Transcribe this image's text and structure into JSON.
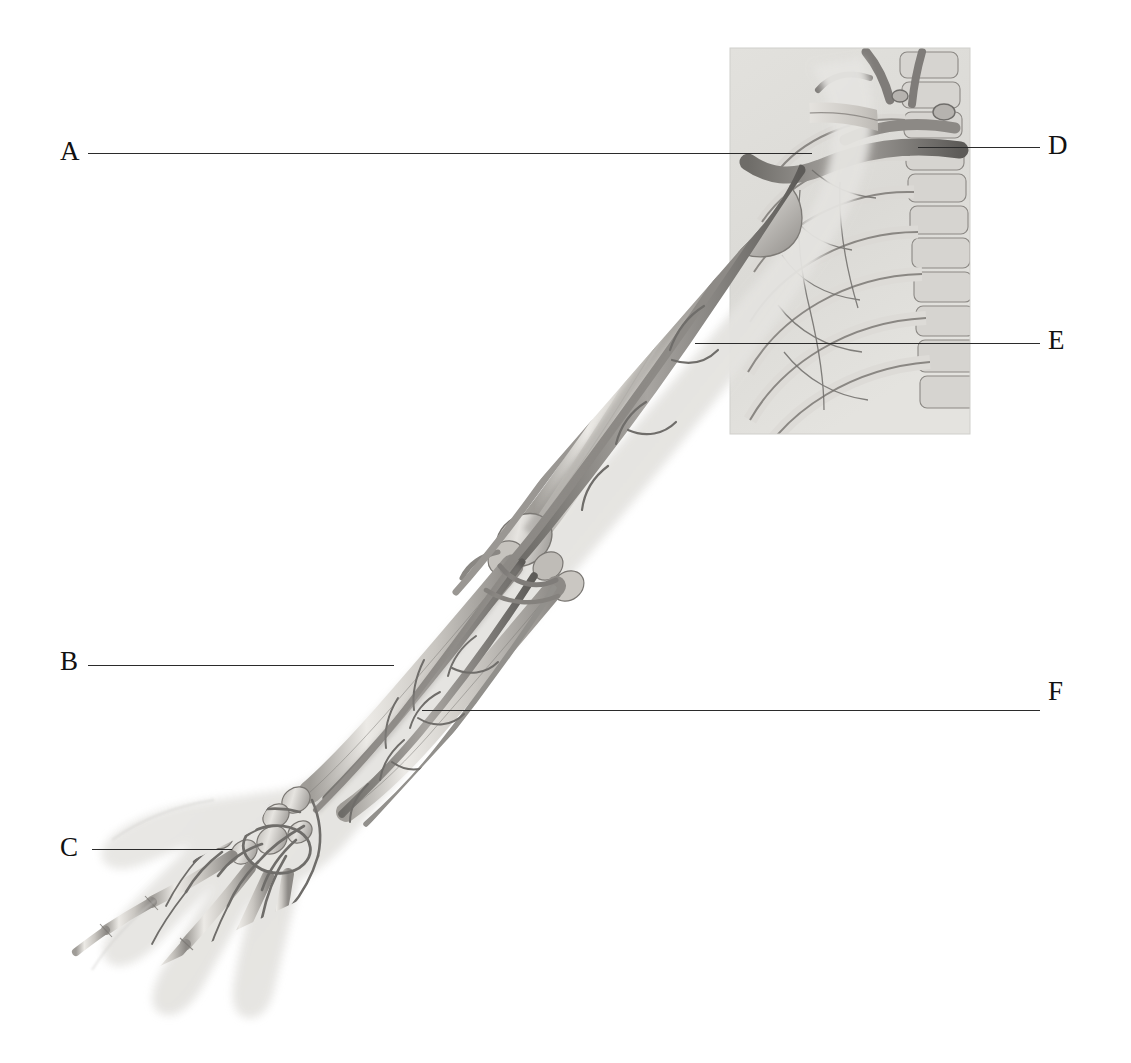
{
  "page": {
    "background_color": "#ffffff",
    "width": 1131,
    "height": 1063,
    "kind": "anatomical-illustration"
  },
  "illustration": {
    "style": "grayscale pencil / airbrush medical illustration",
    "skin_silhouette_color": "#e9e9e9",
    "bone_light": "#dedcd8",
    "bone_mid": "#b4b1ac",
    "bone_dark": "#8b8884",
    "vessel_color": "#7d7b77",
    "vessel_dark": "#5e5c59",
    "thorax_panel": {
      "description": "rectangular cropped panel showing ribcage, clavicle, scapula and vertebral column",
      "left": 730,
      "top": 48,
      "right": 970,
      "bottom": 434,
      "fill": "#dcdbd7"
    },
    "regions": [
      "shoulder girdle with clavicle and scapula",
      "humerus with brachial vessels",
      "elbow joint with radial and ulnar bifurcation",
      "radius and ulna of forearm",
      "carpal bones and dorsal venous network",
      "metacarpals and phalanges of the hand",
      "rib cage with intercostal vessels",
      "cervical and thoracic vertebrae"
    ]
  },
  "labels": [
    {
      "id": "A",
      "text": "A",
      "side": "left",
      "label_x": 60,
      "label_y": 138,
      "line_x1": 88,
      "line_x2": 812,
      "line_y1": 153,
      "line_y2": 153
    },
    {
      "id": "B",
      "text": "B",
      "side": "left",
      "label_x": 60,
      "label_y": 648,
      "line_x1": 88,
      "line_x2": 394,
      "line_y1": 665,
      "line_y2": 665
    },
    {
      "id": "C",
      "text": "C",
      "side": "left",
      "label_x": 60,
      "label_y": 834,
      "line_x1": 92,
      "line_x2": 232,
      "line_y1": 849,
      "line_y2": 849
    },
    {
      "id": "D",
      "text": "D",
      "side": "right",
      "label_x": 1048,
      "label_y": 132,
      "line_x1": 918,
      "line_x2": 1040,
      "line_y1": 147,
      "line_y2": 147
    },
    {
      "id": "E",
      "text": "E",
      "side": "right",
      "label_x": 1048,
      "label_y": 327,
      "line_x1": 695,
      "line_x2": 1040,
      "line_y1": 343,
      "line_y2": 343
    },
    {
      "id": "F",
      "text": "F",
      "side": "right",
      "label_x": 1048,
      "label_y": 678,
      "line_x1": 422,
      "line_x2": 1040,
      "line_y1": 710,
      "line_y2": 710
    }
  ],
  "leader_line": {
    "color": "#2b2b2b",
    "thickness_px": 1.4
  }
}
